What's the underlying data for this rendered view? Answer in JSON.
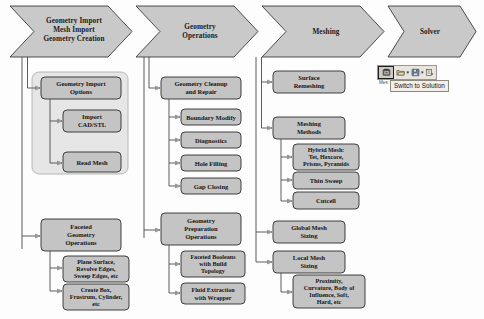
{
  "diagram": {
    "title_caption": "",
    "banner_stages": [
      {
        "id": "stage-geometry-import",
        "lines": [
          "Geometry Import",
          "Mesh Import",
          "Geometry Creation"
        ]
      },
      {
        "id": "stage-geometry-operations",
        "lines": [
          "Geometry",
          "Operations"
        ]
      },
      {
        "id": "stage-meshing",
        "lines": [
          "Meshing"
        ]
      },
      {
        "id": "stage-solver",
        "lines": [
          "Solver"
        ]
      }
    ],
    "columns": [
      {
        "id": "column-geometry-import",
        "boxes": [
          {
            "id": "box-geometry-import-options",
            "lines": [
              "Geometry Import",
              "Options"
            ]
          },
          {
            "id": "box-import-cad-stl",
            "lines": [
              "Import",
              "CAD/STL"
            ]
          },
          {
            "id": "box-read-mesh",
            "lines": [
              "Read Mesh"
            ]
          },
          {
            "id": "box-faceted-geometry-operations",
            "lines": [
              "Faceted",
              "Geometry",
              "Operations"
            ]
          },
          {
            "id": "box-plane-surface",
            "lines": [
              "Plane Surface,",
              "Revolve Edges,",
              "Sweep Edges, etc"
            ]
          },
          {
            "id": "box-create-box",
            "lines": [
              "Create Box,",
              "Frustrum, Cylinder,",
              "etc"
            ]
          }
        ]
      },
      {
        "id": "column-geometry-operations",
        "boxes": [
          {
            "id": "box-geometry-cleanup-and-repair",
            "lines": [
              "Geometry Cleanup",
              "and Repair"
            ]
          },
          {
            "id": "box-boundary-modify",
            "lines": [
              "Boundary Modify"
            ]
          },
          {
            "id": "box-diagnostics",
            "lines": [
              "Diagnostics"
            ]
          },
          {
            "id": "box-hole-filling",
            "lines": [
              "Hole Filling"
            ]
          },
          {
            "id": "box-gap-closing",
            "lines": [
              "Gap Closing"
            ]
          },
          {
            "id": "box-geometry-preparation-operations",
            "lines": [
              "Geometry",
              "Preparation",
              "Operations"
            ]
          },
          {
            "id": "box-faceted-booleans",
            "lines": [
              "Faceted Booleans",
              "with Build",
              "Topology"
            ]
          },
          {
            "id": "box-fluid-extraction",
            "lines": [
              "Fluid Extraction",
              "with Wrapper"
            ]
          }
        ]
      },
      {
        "id": "column-meshing",
        "boxes": [
          {
            "id": "box-surface-remeshing",
            "lines": [
              "Surface",
              "Remeshing"
            ]
          },
          {
            "id": "box-meshing-methods",
            "lines": [
              "Meshing",
              "Methods"
            ]
          },
          {
            "id": "box-hybrid-mesh",
            "lines": [
              "Hybrid Mesh:",
              "Tet, Hexcore,",
              "Prisms, Pyramids"
            ]
          },
          {
            "id": "box-thin-sweep",
            "lines": [
              "Thin Sweep"
            ]
          },
          {
            "id": "box-cutcell",
            "lines": [
              "Cutcell"
            ]
          },
          {
            "id": "box-global-mesh-sizing",
            "lines": [
              "Global Mesh",
              "Sizing"
            ]
          },
          {
            "id": "box-local-mesh-sizing",
            "lines": [
              "Local Mesh",
              "Sizing"
            ]
          },
          {
            "id": "box-proximity-curvature",
            "lines": [
              "Proximity,",
              "Curvature, Body of",
              "Influence, Soft,",
              "Hard, etc"
            ]
          }
        ]
      }
    ]
  },
  "toolbar": {
    "selected_button_name": "switch-to-solution",
    "tooltip": "Switch to Solution",
    "under_label": "Mes",
    "buttons": [
      {
        "id": "tb-switch-to-solution",
        "icon": "switch-to-solution-icon",
        "selected": true
      },
      {
        "id": "tb-open",
        "icon": "open-folder-icon",
        "has_caret": true
      },
      {
        "id": "tb-save",
        "icon": "save-disk-icon",
        "has_caret": true
      },
      {
        "id": "tb-export",
        "icon": "export-icon",
        "has_caret": false
      }
    ]
  },
  "colors": {
    "banner_fill": "#c9c9c9",
    "banner_stroke": "#3a3a3a",
    "box_fill": "#c4c4c4",
    "box_stroke": "#2e2e2e",
    "group_fill": "#e2e2e2",
    "group_stroke": "#9e9e9e",
    "connector": "#4a4a4a",
    "page_bg": "#fdfdfd"
  }
}
